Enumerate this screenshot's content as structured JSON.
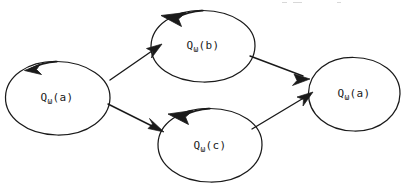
{
  "canvas": {
    "width": 410,
    "height": 187,
    "background": "#ffffff",
    "ink_color": "#1a1a1a",
    "style": "hand-drawn scanned figure"
  },
  "diagram": {
    "type": "directed-graph",
    "nodes": [
      {
        "id": "left",
        "label_base": "Q",
        "label_sub": "ω",
        "label_arg": "(a)",
        "label_full": "Qω(a)",
        "cx": 57,
        "cy": 98,
        "rx": 52,
        "ry": 37,
        "has_loop_arrow": true,
        "loop_direction": "counterclockwise"
      },
      {
        "id": "top",
        "label_base": "Q",
        "label_sub": "ω",
        "label_arg": "(b)",
        "label_full": "Qω(b)",
        "cx": 203,
        "cy": 46,
        "rx": 52,
        "ry": 36,
        "has_loop_arrow": true,
        "loop_direction": "counterclockwise"
      },
      {
        "id": "bottom",
        "label_base": "Q",
        "label_sub": "ω",
        "label_arg": "(c)",
        "label_full": "Qω(c)",
        "cx": 210,
        "cy": 145,
        "rx": 52,
        "ry": 37,
        "has_loop_arrow": true,
        "loop_direction": "counterclockwise"
      },
      {
        "id": "right",
        "label_base": "Q",
        "label_sub": "ω",
        "label_arg": "(a)",
        "label_full": "Qω(a)",
        "cx": 354,
        "cy": 94,
        "rx": 46,
        "ry": 37,
        "has_loop_arrow": false,
        "loop_direction": ""
      }
    ],
    "edges": [
      {
        "id": "left-to-top",
        "from": "left",
        "to": "top",
        "x1": 110,
        "y1": 80,
        "x2": 160,
        "y2": 46
      },
      {
        "id": "left-to-bottom",
        "from": "left",
        "to": "bottom",
        "x1": 108,
        "y1": 104,
        "x2": 163,
        "y2": 131
      },
      {
        "id": "top-to-right",
        "from": "top",
        "to": "right",
        "x1": 250,
        "y1": 56,
        "x2": 308,
        "y2": 78
      },
      {
        "id": "bottom-to-right",
        "from": "bottom",
        "to": "right",
        "x1": 252,
        "y1": 129,
        "x2": 312,
        "y2": 94
      }
    ]
  }
}
